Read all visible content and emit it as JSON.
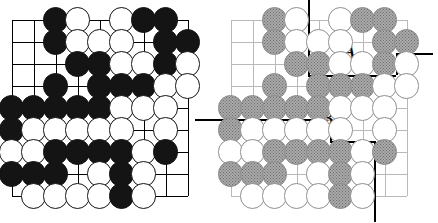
{
  "figure": {
    "type": "go-board-diagram",
    "panels": [
      {
        "id": "left",
        "name": "position-diagram",
        "stone_style": "black-and-white",
        "marker": {
          "type": "triangle",
          "col": 8,
          "row": 7,
          "on": "black"
        }
      },
      {
        "id": "right",
        "name": "territory-diagram",
        "stone_style": "grey-and-white",
        "marker": {
          "type": "triangle",
          "col": 8,
          "row": 7,
          "on": "black"
        },
        "labels": [
          {
            "text": "A",
            "col": 6.35,
            "row": 2.4
          },
          {
            "text": "B",
            "col": 5.35,
            "row": 5.45
          },
          {
            "text": "C",
            "col": 3.1,
            "row": 7.55
          }
        ]
      }
    ],
    "board": {
      "cols": 9,
      "rows": 9,
      "colors": {
        "black_stone": "#141414",
        "white_stone": "#ffffff",
        "grey_stone": "#a9a9a9",
        "line_left": "#000000",
        "line_right": "#b9b9b9",
        "boundary": "#000000",
        "label": "#0b0b0b"
      }
    },
    "stones": [
      {
        "col": 3,
        "row": 1,
        "color": "b"
      },
      {
        "col": 4,
        "row": 1,
        "color": "w"
      },
      {
        "col": 6,
        "row": 1,
        "color": "w"
      },
      {
        "col": 7,
        "row": 1,
        "color": "b"
      },
      {
        "col": 8,
        "row": 1,
        "color": "b"
      },
      {
        "col": 3,
        "row": 2,
        "color": "b"
      },
      {
        "col": 4,
        "row": 2,
        "color": "w"
      },
      {
        "col": 5,
        "row": 2,
        "color": "w"
      },
      {
        "col": 6,
        "row": 2,
        "color": "w"
      },
      {
        "col": 8,
        "row": 2,
        "color": "b"
      },
      {
        "col": 9,
        "row": 2,
        "color": "b"
      },
      {
        "col": 4,
        "row": 3,
        "color": "b"
      },
      {
        "col": 5,
        "row": 3,
        "color": "b"
      },
      {
        "col": 6,
        "row": 3,
        "color": "w"
      },
      {
        "col": 7,
        "row": 3,
        "color": "w"
      },
      {
        "col": 8,
        "row": 3,
        "color": "b"
      },
      {
        "col": 9,
        "row": 3,
        "color": "w"
      },
      {
        "col": 3,
        "row": 4,
        "color": "b"
      },
      {
        "col": 5,
        "row": 4,
        "color": "b"
      },
      {
        "col": 6,
        "row": 4,
        "color": "b"
      },
      {
        "col": 7,
        "row": 4,
        "color": "b"
      },
      {
        "col": 8,
        "row": 4,
        "color": "w"
      },
      {
        "col": 9,
        "row": 4,
        "color": "w"
      },
      {
        "col": 1,
        "row": 5,
        "color": "b"
      },
      {
        "col": 2,
        "row": 5,
        "color": "b"
      },
      {
        "col": 3,
        "row": 5,
        "color": "b"
      },
      {
        "col": 4,
        "row": 5,
        "color": "b"
      },
      {
        "col": 5,
        "row": 5,
        "color": "b"
      },
      {
        "col": 6,
        "row": 5,
        "color": "w"
      },
      {
        "col": 7,
        "row": 5,
        "color": "w"
      },
      {
        "col": 8,
        "row": 5,
        "color": "w"
      },
      {
        "col": 1,
        "row": 6,
        "color": "b"
      },
      {
        "col": 2,
        "row": 6,
        "color": "w"
      },
      {
        "col": 3,
        "row": 6,
        "color": "w"
      },
      {
        "col": 4,
        "row": 6,
        "color": "w"
      },
      {
        "col": 5,
        "row": 6,
        "color": "w"
      },
      {
        "col": 6,
        "row": 6,
        "color": "w"
      },
      {
        "col": 8,
        "row": 6,
        "color": "w"
      },
      {
        "col": 1,
        "row": 7,
        "color": "w"
      },
      {
        "col": 2,
        "row": 7,
        "color": "w"
      },
      {
        "col": 3,
        "row": 7,
        "color": "b"
      },
      {
        "col": 4,
        "row": 7,
        "color": "b"
      },
      {
        "col": 5,
        "row": 7,
        "color": "b"
      },
      {
        "col": 6,
        "row": 7,
        "color": "b"
      },
      {
        "col": 7,
        "row": 7,
        "color": "w"
      },
      {
        "col": 8,
        "row": 7,
        "color": "b"
      },
      {
        "col": 1,
        "row": 8,
        "color": "b"
      },
      {
        "col": 2,
        "row": 8,
        "color": "b"
      },
      {
        "col": 3,
        "row": 8,
        "color": "b"
      },
      {
        "col": 5,
        "row": 8,
        "color": "w"
      },
      {
        "col": 6,
        "row": 8,
        "color": "b"
      },
      {
        "col": 7,
        "row": 8,
        "color": "w"
      },
      {
        "col": 2,
        "row": 9,
        "color": "w"
      },
      {
        "col": 3,
        "row": 9,
        "color": "w"
      },
      {
        "col": 4,
        "row": 9,
        "color": "w"
      },
      {
        "col": 5,
        "row": 9,
        "color": "w"
      },
      {
        "col": 6,
        "row": 9,
        "color": "b"
      },
      {
        "col": 7,
        "row": 9,
        "color": "w"
      }
    ],
    "boundary_segments": [
      {
        "orient": "v",
        "col": 4.5,
        "from_row": -0.6,
        "to_row": 3.5
      },
      {
        "orient": "h",
        "row": 3.5,
        "from_col": 4.5,
        "to_col": 8.5
      },
      {
        "orient": "v",
        "col": 8.5,
        "from_row": 2.5,
        "to_row": 3.5
      },
      {
        "orient": "h",
        "row": 2.5,
        "from_col": 8.5,
        "to_col": 10.2
      },
      {
        "orient": "h",
        "row": 5.5,
        "from_col": -0.6,
        "to_col": 5.5
      },
      {
        "orient": "v",
        "col": 5.5,
        "from_row": 5.5,
        "to_row": 6.5
      },
      {
        "orient": "h",
        "row": 6.5,
        "from_col": 5.5,
        "to_col": 7.5
      },
      {
        "orient": "v",
        "col": 7.5,
        "from_row": 6.5,
        "to_row": 10.2
      }
    ]
  }
}
